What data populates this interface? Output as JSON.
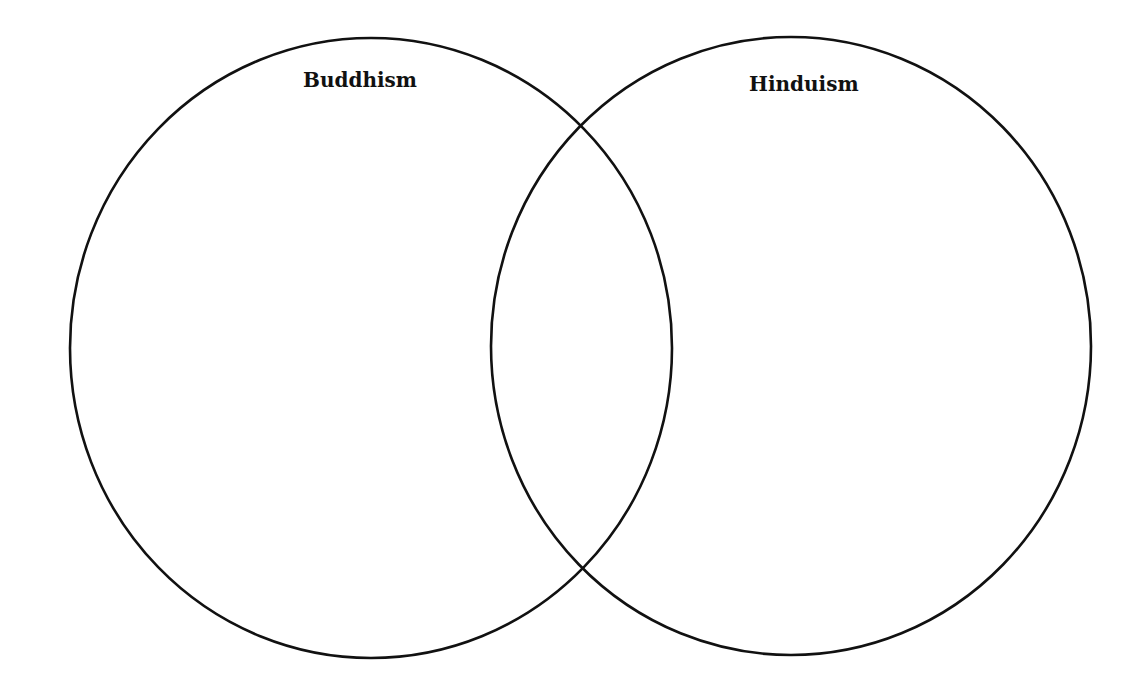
{
  "diagram": {
    "type": "venn",
    "sets": [
      {
        "id": "left",
        "label": "Buddhism",
        "cx": 371,
        "cy": 348,
        "rx": 301,
        "ry": 310,
        "label_x": 303,
        "label_y": 68
      },
      {
        "id": "right",
        "label": "Hinduism",
        "cx": 791,
        "cy": 346,
        "rx": 300,
        "ry": 309,
        "label_x": 749,
        "label_y": 72
      }
    ],
    "stroke_color": "#111111",
    "background": "#ffffff"
  }
}
